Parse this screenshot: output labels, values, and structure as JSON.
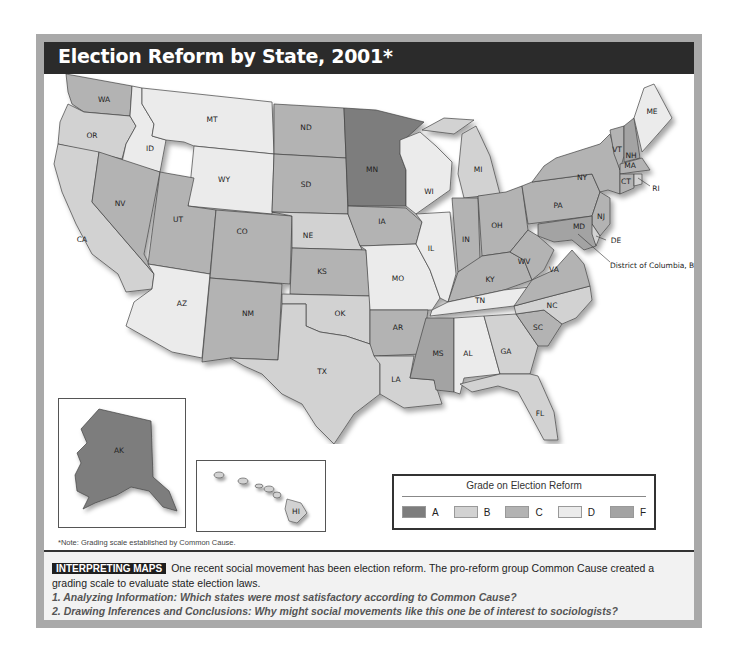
{
  "title": "Election Reform by State, 2001*",
  "legend": {
    "title": "Grade on Election Reform",
    "items": [
      {
        "grade": "A",
        "color": "#7d7d7d"
      },
      {
        "grade": "B",
        "color": "#d2d2d2"
      },
      {
        "grade": "C",
        "color": "#b3b3b3"
      },
      {
        "grade": "D",
        "color": "#ebebeb"
      },
      {
        "grade": "F",
        "color": "#a3a3a3"
      }
    ]
  },
  "colors": {
    "A": "#7d7d7d",
    "B": "#d2d2d2",
    "C": "#b3b3b3",
    "D": "#ebebeb",
    "F": "#a3a3a3"
  },
  "states": {
    "WA": "C",
    "OR": "B",
    "CA": "B",
    "ID": "D",
    "MT": "D",
    "WY": "D",
    "NV": "C",
    "UT": "C",
    "AZ": "D",
    "CO": "C",
    "NM": "C",
    "ND": "C",
    "SD": "C",
    "NE": "B",
    "KS": "C",
    "OK": "B",
    "TX": "B",
    "MN": "A",
    "IA": "C",
    "MO": "D",
    "AR": "C",
    "LA": "B",
    "WI": "D",
    "IL": "D",
    "MI": "B",
    "IN": "C",
    "OH": "C",
    "KY": "C",
    "TN": "D",
    "MS": "F",
    "AL": "D",
    "GA": "B",
    "FL": "B",
    "SC": "C",
    "NC": "B",
    "VA": "C",
    "WV": "C",
    "PA": "C",
    "NY": "C",
    "NJ": "C",
    "DE": "B",
    "MD": "F",
    "VT": "C",
    "NH": "F",
    "ME": "D",
    "MA": "C",
    "CT": "C",
    "RI": "B",
    "AK": "A",
    "HI": "B"
  },
  "callouts": {
    "RI": "RI",
    "DE": "DE",
    "DC": "District of Columbia, B"
  },
  "note": "*Note: Grading scale established by Common Cause.",
  "interpreting": {
    "badge": "INTERPRETING MAPS",
    "text": "One recent social movement has been election reform. The pro-reform group Common Cause created a grading scale to evaluate state election laws.",
    "q1": "1. Analyzing Information: Which states were most satisfactory according to Common Cause?",
    "q2": "2. Drawing Inferences and Conclusions: Why might social movements like this one be of interest to sociologists?"
  }
}
